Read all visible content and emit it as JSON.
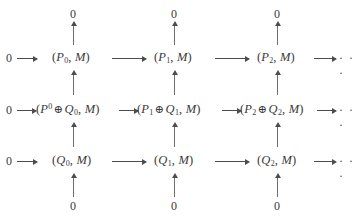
{
  "diagram": {
    "kind": "commutative-diagram",
    "background_color": "#ffffff",
    "text_color": "#3a3a3a",
    "arrow_color": "#4d4d4d",
    "zero_label": "0",
    "ellipsis": "· · ·",
    "oplus": "⊕",
    "comma": ",",
    "open_paren": "(",
    "close_paren": ")",
    "second_arg": "M",
    "rows": [
      {
        "name": "top-row",
        "leading_zero": "0",
        "trailing_ellipsis": "· · ·",
        "cells": [
          {
            "base": "P",
            "index": "0",
            "index_kind": "sub",
            "text": "(P0, M)"
          },
          {
            "base": "P",
            "index": "1",
            "index_kind": "sub",
            "text": "(P1, M)"
          },
          {
            "base": "P",
            "index": "2",
            "index_kind": "sub",
            "text": "(P2, M)"
          }
        ]
      },
      {
        "name": "middle-row",
        "leading_zero": "0",
        "trailing_ellipsis": "· · ·",
        "cells": [
          {
            "left_base": "P",
            "left_index": "0",
            "left_index_kind": "sup",
            "right_base": "Q",
            "right_index": "0",
            "right_index_kind": "sub",
            "text": "(P^0 ⊕ Q0, M)"
          },
          {
            "left_base": "P",
            "left_index": "1",
            "left_index_kind": "sub",
            "right_base": "Q",
            "right_index": "1",
            "right_index_kind": "sub",
            "text": "(P1 ⊕ Q1, M)"
          },
          {
            "left_base": "P",
            "left_index": "2",
            "left_index_kind": "sub",
            "right_base": "Q",
            "right_index": "2",
            "right_index_kind": "sub",
            "text": "(P2 ⊕ Q2, M)"
          }
        ]
      },
      {
        "name": "bottom-row",
        "leading_zero": "0",
        "trailing_ellipsis": "· · ·",
        "cells": [
          {
            "base": "Q",
            "index": "0",
            "index_kind": "sub",
            "text": "(Q0, M)"
          },
          {
            "base": "Q",
            "index": "1",
            "index_kind": "sub",
            "text": "(Q1, M)"
          },
          {
            "base": "Q",
            "index": "2",
            "index_kind": "sub",
            "text": "(Q2, M)"
          }
        ]
      }
    ],
    "top_zeros": [
      "0",
      "0",
      "0"
    ],
    "bottom_zeros": [
      "0",
      "0",
      "0"
    ]
  }
}
